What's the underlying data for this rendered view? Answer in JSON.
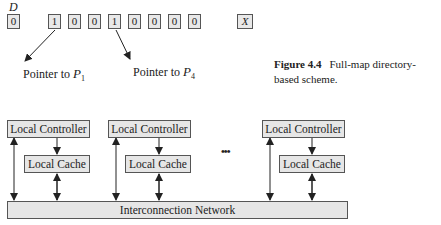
{
  "directory": {
    "label": "D",
    "present_bit": "0",
    "bits": [
      "1",
      "0",
      "0",
      "1",
      "0",
      "0",
      "0",
      "0"
    ],
    "dirty_bit": "X"
  },
  "pointers": [
    {
      "prefix": "Pointer to ",
      "var": "P",
      "sub": "1"
    },
    {
      "prefix": "Pointer to ",
      "var": "P",
      "sub": "4"
    }
  ],
  "caption": {
    "figure": "Figure 4.4",
    "text": "Full-map directory-based scheme."
  },
  "nodes": [
    {
      "controller": "Local Controller",
      "cache": "Local Cache"
    },
    {
      "controller": "Local Controller",
      "cache": "Local Cache"
    },
    {
      "controller": "Local Controller",
      "cache": "Local Cache"
    }
  ],
  "ellipsis": "•••",
  "network": {
    "label": "Interconnection Network"
  },
  "colors": {
    "box_fill": "#e6e6e6",
    "box_border": "#555555",
    "line": "#222222"
  }
}
